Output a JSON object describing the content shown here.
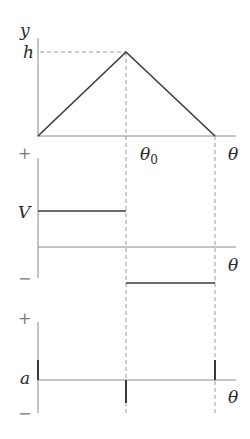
{
  "colors": {
    "curve": "#3a3a3a",
    "axis": "#8a8a8a",
    "dashed": "#9a9a9a",
    "text": "#2a2a2a"
  },
  "top_chart": {
    "y_axis_label": "y",
    "peak_label": "h",
    "peak_x_label": "θ",
    "peak_x_subscript": "0",
    "x_axis_label": "θ"
  },
  "middle_chart": {
    "plus_label": "+",
    "minus_label": "−",
    "level_label": "V",
    "x_axis_label": "θ"
  },
  "bottom_chart": {
    "plus_label": "+",
    "minus_label": "−",
    "level_label": "a",
    "x_axis_label": "θ"
  }
}
